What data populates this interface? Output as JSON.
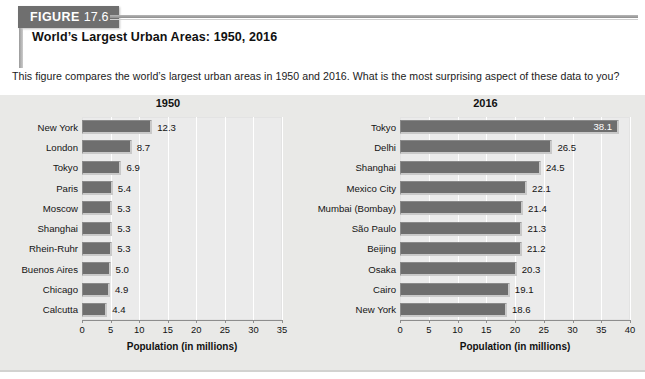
{
  "figure": {
    "label_word": "FIGURE",
    "number": "17.6",
    "title": "World’s Largest Urban Areas: 1950, 2016",
    "description": "This figure compares the world’s largest urban areas in 1950 and 2016. What is the most surprising aspect of these data to you?"
  },
  "colors": {
    "banner": "#6f6f6f",
    "panel_bg": "#e9e9e7",
    "plot_bg": "#ebebeb",
    "bar_fill": "#6e6e6e",
    "gridline": "#ffffff"
  },
  "chart_data": [
    {
      "type": "bar",
      "title": "1950",
      "orientation": "horizontal",
      "xlabel": "Population (in millions)",
      "ylabel": "",
      "xlim": [
        0,
        35
      ],
      "xticks": [
        0,
        5,
        10,
        15,
        20,
        25,
        30,
        35
      ],
      "grid": true,
      "legend": "none",
      "categories": [
        "New York",
        "London",
        "Tokyo",
        "Paris",
        "Moscow",
        "Shanghai",
        "Rhein-Ruhr",
        "Buenos Aires",
        "Chicago",
        "Calcutta"
      ],
      "values": [
        12.3,
        8.7,
        6.9,
        5.4,
        5.3,
        5.3,
        5.3,
        5.0,
        4.9,
        4.4
      ],
      "value_labels": [
        "12.3",
        "8.7",
        "6.9",
        "5.4",
        "5.3",
        "5.3",
        "5.3",
        "5.0",
        "4.9",
        "4.4"
      ],
      "label_inside": [
        false,
        false,
        false,
        false,
        false,
        false,
        false,
        false,
        false,
        false
      ]
    },
    {
      "type": "bar",
      "title": "2016",
      "orientation": "horizontal",
      "xlabel": "Population (in millions)",
      "ylabel": "",
      "xlim": [
        0,
        40
      ],
      "xticks": [
        0,
        5,
        10,
        15,
        20,
        25,
        30,
        35,
        40
      ],
      "grid": true,
      "legend": "none",
      "categories": [
        "Tokyo",
        "Delhi",
        "Shanghai",
        "Mexico City",
        "Mumbai (Bombay)",
        "São Paulo",
        "Beijing",
        "Osaka",
        "Cairo",
        "New York"
      ],
      "values": [
        38.1,
        26.5,
        24.5,
        22.1,
        21.4,
        21.3,
        21.2,
        20.3,
        19.1,
        18.6
      ],
      "value_labels": [
        "38.1",
        "26.5",
        "24.5",
        "22.1",
        "21.4",
        "21.3",
        "21.2",
        "20.3",
        "19.1",
        "18.6"
      ],
      "label_inside": [
        true,
        false,
        false,
        false,
        false,
        false,
        false,
        false,
        false,
        false
      ]
    }
  ]
}
